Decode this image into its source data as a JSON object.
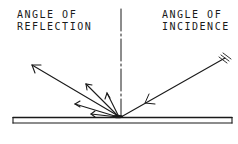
{
  "diagram": {
    "labels": {
      "reflection_line1": "ANGLE OF",
      "reflection_line2": "REFLECTION",
      "incidence_line1": "ANGLE OF",
      "incidence_line2": "INCIDENCE"
    },
    "colors": {
      "stroke": "#1a1a1a",
      "background": "#ffffff"
    },
    "elements": [
      {
        "name": "surface",
        "type": "plate"
      },
      {
        "name": "normal-line",
        "type": "dash-dot-line"
      },
      {
        "name": "incident-ray",
        "type": "arrow",
        "direction": "toward-surface"
      },
      {
        "name": "specular-reflected-ray",
        "type": "arrow"
      },
      {
        "name": "diffuse-reflected-rays",
        "type": "arrow-group",
        "count": 4
      }
    ]
  }
}
